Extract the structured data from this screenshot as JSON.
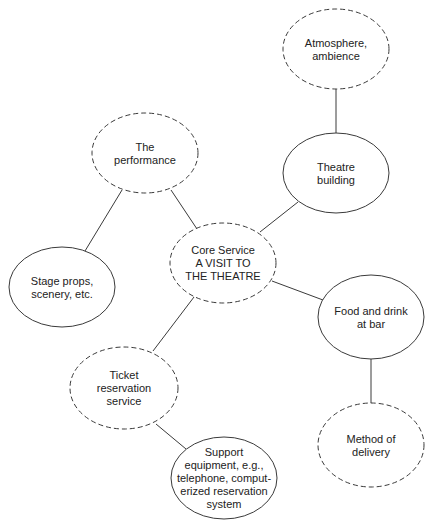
{
  "diagram": {
    "nodes": [
      {
        "id": "atmosphere",
        "lines": [
          "Atmosphere,",
          "ambience"
        ],
        "style": "dashed"
      },
      {
        "id": "theatre-building",
        "lines": [
          "Theatre",
          "building"
        ],
        "style": "solid"
      },
      {
        "id": "performance",
        "lines": [
          "The",
          "performance"
        ],
        "style": "dashed"
      },
      {
        "id": "core",
        "lines": [
          "Core Service",
          "A VISIT TO",
          "THE THEATRE"
        ],
        "style": "dashed"
      },
      {
        "id": "stage-props",
        "lines": [
          "Stage props,",
          "scenery, etc."
        ],
        "style": "solid"
      },
      {
        "id": "food-drink",
        "lines": [
          "Food and drink",
          "at bar"
        ],
        "style": "solid"
      },
      {
        "id": "ticket",
        "lines": [
          "Ticket",
          "reservation",
          "service"
        ],
        "style": "dashed"
      },
      {
        "id": "method",
        "lines": [
          "Method of",
          "delivery"
        ],
        "style": "dashed"
      },
      {
        "id": "support",
        "lines": [
          "Support",
          "equipment, e.g.,",
          "telephone, comput-",
          "erized reservation",
          "system"
        ],
        "style": "solid"
      }
    ],
    "edges": [
      {
        "from": "atmosphere",
        "to": "theatre-building"
      },
      {
        "from": "theatre-building",
        "to": "core"
      },
      {
        "from": "performance",
        "to": "core"
      },
      {
        "from": "performance",
        "to": "stage-props"
      },
      {
        "from": "core",
        "to": "food-drink"
      },
      {
        "from": "core",
        "to": "ticket"
      },
      {
        "from": "ticket",
        "to": "support"
      },
      {
        "from": "food-drink",
        "to": "method"
      }
    ]
  }
}
